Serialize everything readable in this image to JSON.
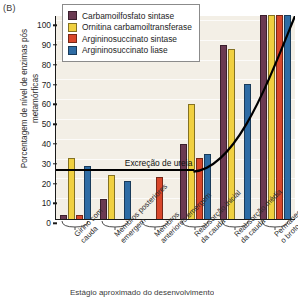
{
  "panel": {
    "label": "(B)"
  },
  "legend": {
    "items": [
      {
        "label": "Carbamoilfosfato sintase",
        "color": "#6b3a52"
      },
      {
        "label": "Ornitina carbamoiltransferase",
        "color": "#f0d040"
      },
      {
        "label": "Argininosuccinato sintase",
        "color": "#d8472b"
      },
      {
        "label": "Argininosuccinato liase",
        "color": "#2e6ca4"
      }
    ]
  },
  "annotation": {
    "urea_label": "Excreção de ureia"
  },
  "axis_title_bottom": "Estágio aproximado do desenvolvimento",
  "chart_data": {
    "type": "bar",
    "title": "",
    "subtitle": "",
    "xlabel": "Estágio aproximado do desenvolvimento",
    "ylabel": "Porcentagem de nível de enzimas pós metamórficas",
    "ylim": [
      0,
      103
    ],
    "yticks": [
      0,
      10,
      20,
      30,
      40,
      50,
      60,
      70,
      80,
      90,
      100
    ],
    "grid": true,
    "legend_position": "top-center",
    "categories": [
      "Girino com cauda",
      "Membros posteriores emergem",
      "Membros anteriores emergem",
      "Reabsorção inicial da cauda",
      "Reabsorção média da cauda",
      "Permanece somente o broto da cauda"
    ],
    "series": [
      {
        "name": "Carbamoilfosfato sintase",
        "color": "#6b3a52",
        "values": [
          2,
          10,
          null,
          38,
          88,
          103
        ]
      },
      {
        "name": "Ornitina carbamoiltransferase",
        "color": "#f0d040",
        "values": [
          31,
          22,
          null,
          58,
          86,
          103
        ]
      },
      {
        "name": "Argininosuccinato sintase",
        "color": "#d8472b",
        "values": [
          2,
          null,
          21,
          31,
          null,
          103
        ]
      },
      {
        "name": "Argininosuccinato liase",
        "color": "#2e6ca4",
        "values": [
          27,
          19,
          null,
          33,
          68,
          103
        ]
      }
    ],
    "annotations": [
      {
        "text": "Excreção de ureia",
        "type": "curve",
        "start_value": 24,
        "end_value": 103
      }
    ]
  }
}
